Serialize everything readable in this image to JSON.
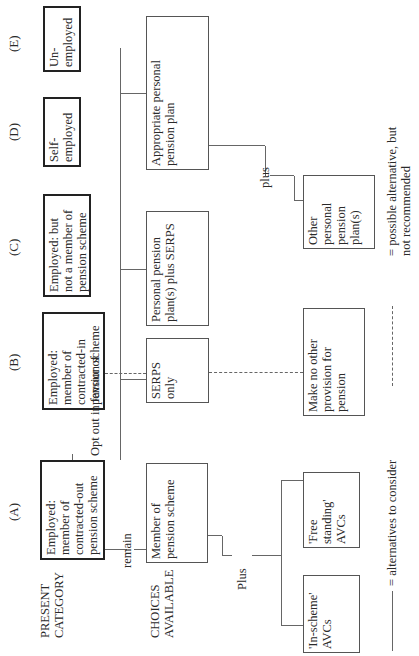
{
  "row_labels": {
    "present_category": "PRESENT\nCATEGORY",
    "choices_available": "CHOICES\nAVAILABLE"
  },
  "categories": [
    {
      "letter": "(A)",
      "text": "Employed: member of contracted-out pension scheme"
    },
    {
      "letter": "(B)",
      "text": "Employed: member of contracted-in pension scheme"
    },
    {
      "letter": "(C)",
      "text": "Employed: but not a member of pension scheme"
    },
    {
      "letter": "(D)",
      "text": "Self-employed"
    },
    {
      "letter": "(E)",
      "text": "Un-employed"
    }
  ],
  "connectors": {
    "remain": "remain",
    "opt_out": "Opt out in favour of",
    "plus_upper": "Plus",
    "plus_lower": "plus"
  },
  "choices": {
    "member_of_scheme": "Member of pension scheme",
    "serps_only": "SERPS only",
    "personal_plus_serps": "Personal pension plan(s) plus SERPS",
    "appropriate_personal": "Appropriate personal pension plan",
    "in_scheme_avcs": "'In-scheme' AVCs",
    "free_standing_avcs": "'Free standing' AVCs",
    "no_provision": "Make no other provision for pension",
    "other_personal": "Other personal pension plan(s)"
  },
  "legend": {
    "solid": "= alternatives to consider",
    "dashed": "= possible alternative, but not recommended"
  }
}
